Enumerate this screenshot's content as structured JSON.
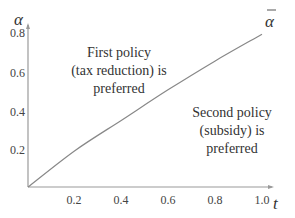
{
  "chart_data": {
    "type": "line",
    "title": "",
    "xlabel": "t",
    "ylabel": "α",
    "xlim": [
      0,
      1.05
    ],
    "ylim": [
      0,
      0.85
    ],
    "grid": false,
    "x_ticks": [
      "0.2",
      "0.4",
      "0.6",
      "0.8",
      "1.0"
    ],
    "y_ticks": [
      "0.2",
      "0.4",
      "0.6",
      "0.8"
    ],
    "series": [
      {
        "name": "ᾱ",
        "x": [
          0,
          0.2,
          0.4,
          0.6,
          0.8,
          1.0
        ],
        "values": [
          0,
          0.19,
          0.35,
          0.51,
          0.66,
          0.8
        ]
      }
    ],
    "annotations": [
      {
        "lines": [
          "First policy",
          "(tax reduction) is",
          "preferred"
        ],
        "region": "above curve"
      },
      {
        "lines": [
          "Second policy",
          "(subsidy) is",
          "preferred"
        ],
        "region": "below curve"
      }
    ],
    "curve_label": "α",
    "curve_label_has_bar": true
  },
  "labels": {
    "x_axis": "t",
    "y_axis": "α",
    "curve": "α",
    "region1": [
      "First policy",
      "(tax reduction) is",
      "preferred"
    ],
    "region2": [
      "Second policy",
      "(subsidy) is",
      "preferred"
    ],
    "xticks": [
      "0.2",
      "0.4",
      "0.6",
      "0.8",
      "1.0"
    ],
    "yticks": [
      "0.2",
      "0.4",
      "0.6",
      "0.8"
    ]
  },
  "colors": {
    "axis": "#999999",
    "curve": "#888888",
    "text": "#333333"
  }
}
